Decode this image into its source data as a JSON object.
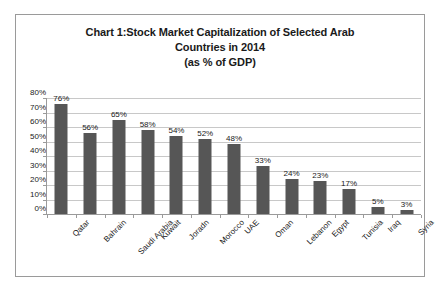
{
  "chart_data": {
    "type": "bar",
    "title": "Chart 1:Stock Market Capitalization of Selected Arab Countries in 2014 (as % of GDP)",
    "title_lines": [
      "Chart 1:Stock Market Capitalization of Selected Arab",
      "Countries in 2014",
      "(as % of GDP)"
    ],
    "categories": [
      "Qatar",
      "Bahrain",
      "Saudi Arabia",
      "Kuwait",
      "Joradn",
      "Morocco",
      "UAE",
      "Oman",
      "Lebanon",
      "Egypt",
      "Tunisia",
      "Iraq",
      "Syria"
    ],
    "values": [
      76,
      56,
      65,
      58,
      54,
      52,
      48,
      33,
      24,
      23,
      17,
      5,
      3
    ],
    "data_labels": [
      "76%",
      "56%",
      "65%",
      "58%",
      "54%",
      "52%",
      "48%",
      "33%",
      "24%",
      "23%",
      "17%",
      "5%",
      "3%"
    ],
    "xlabel": "",
    "ylabel": "",
    "ylim": [
      0,
      80
    ],
    "y_tick_values": [
      0,
      10,
      20,
      30,
      40,
      50,
      60,
      70,
      80
    ],
    "y_tick_labels": [
      "0%",
      "10%",
      "20%",
      "30%",
      "40%",
      "50%",
      "60%",
      "70%",
      "80%"
    ],
    "grid": true,
    "legend": false,
    "series_color": "#565656",
    "gridline_color": "#c8c8c8",
    "axis_color": "#9a9a9a",
    "border_color": "#9a9a9a"
  }
}
